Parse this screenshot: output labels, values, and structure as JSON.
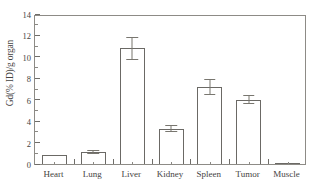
{
  "chart_data": {
    "type": "bar",
    "title": "",
    "subtitle": "",
    "xlabel": "",
    "ylabel": "Gd(% ID)/g organ",
    "categories": [
      "Heart",
      "Lung",
      "Liver",
      "Kidney",
      "Spleen",
      "Tumor",
      "Muscle"
    ],
    "values": [
      0.8,
      1.1,
      10.8,
      3.3,
      7.2,
      6.0,
      0.1
    ],
    "errors": [
      0.0,
      0.15,
      1.0,
      0.3,
      0.7,
      0.35,
      0.0
    ],
    "ylim": [
      0,
      14
    ],
    "ytick_labels": [
      "0",
      "2",
      "4",
      "6",
      "8",
      "10",
      "12",
      "14"
    ],
    "ytick_values": [
      0,
      2,
      4,
      6,
      8,
      10,
      12,
      14
    ],
    "yminor_values": [
      1,
      3,
      5,
      7,
      9,
      11,
      13
    ],
    "grid": false,
    "legend": null,
    "bar_style": "open",
    "bar_fill_color": "#ffffff",
    "bar_edge_color": "#6b6965",
    "error_bar_color": "#78766f",
    "axis_color": "#8d8b86",
    "text_color": "#45433f",
    "background_color": "#ffffff",
    "annotations": []
  }
}
